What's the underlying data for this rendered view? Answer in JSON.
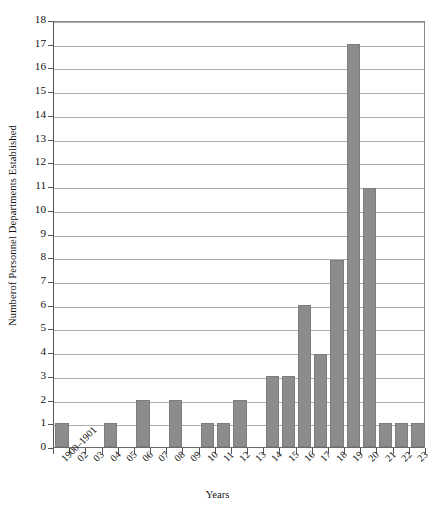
{
  "chart_data": {
    "type": "bar",
    "title": "",
    "xlabel": "Years",
    "ylabel": "Numberof Personnel Departments Established",
    "categories": [
      "1900–1901",
      "02",
      "03",
      "04",
      "05",
      "06",
      "07",
      "08",
      "09",
      "10",
      "11",
      "12",
      "13",
      "14",
      "15",
      "16",
      "17",
      "18",
      "19",
      "20",
      "21",
      "22",
      "23"
    ],
    "values": [
      1,
      0,
      0,
      1,
      0,
      2,
      0,
      2,
      0,
      1,
      1,
      2,
      0,
      3,
      3,
      6,
      3.9,
      7.9,
      17,
      10.9,
      1,
      1,
      1
    ],
    "ylim": [
      0,
      18
    ],
    "ytick_labels": [
      "0",
      "1",
      "2",
      "3",
      "4",
      "5",
      "6",
      "7",
      "8",
      "9",
      "10",
      "11",
      "12",
      "13",
      "14",
      "15",
      "16",
      "17",
      "18"
    ],
    "ytick_values": [
      0,
      1,
      2,
      3,
      4,
      5,
      6,
      7,
      8,
      9,
      10,
      11,
      12,
      13,
      14,
      15,
      16,
      17,
      18
    ],
    "grid": true,
    "legend": "none",
    "bar_color": "#8c8c8c",
    "grid_color": "#adadad",
    "axis_color": "#555555",
    "background": "#ffffff"
  }
}
